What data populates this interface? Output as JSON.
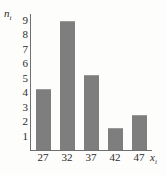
{
  "chart_data": {
    "type": "bar",
    "title": "",
    "xlabel": "x",
    "xlabel_sub": "i",
    "ylabel": "n",
    "ylabel_sub": "i",
    "categories": [
      "27",
      "32",
      "37",
      "42",
      "47"
    ],
    "values": [
      4.2,
      8.9,
      5.2,
      1.5,
      2.4
    ],
    "yticks": [
      "9",
      "8",
      "7",
      "6",
      "5",
      "4",
      "3",
      "2",
      "1"
    ],
    "ylim": [
      0,
      9.4
    ],
    "grid": false,
    "legend": null,
    "bar_color": "#7e7e7e",
    "axis_color": "#6f6f6f",
    "text_color": "#2b2b2b",
    "background": "#fdfdfb"
  }
}
